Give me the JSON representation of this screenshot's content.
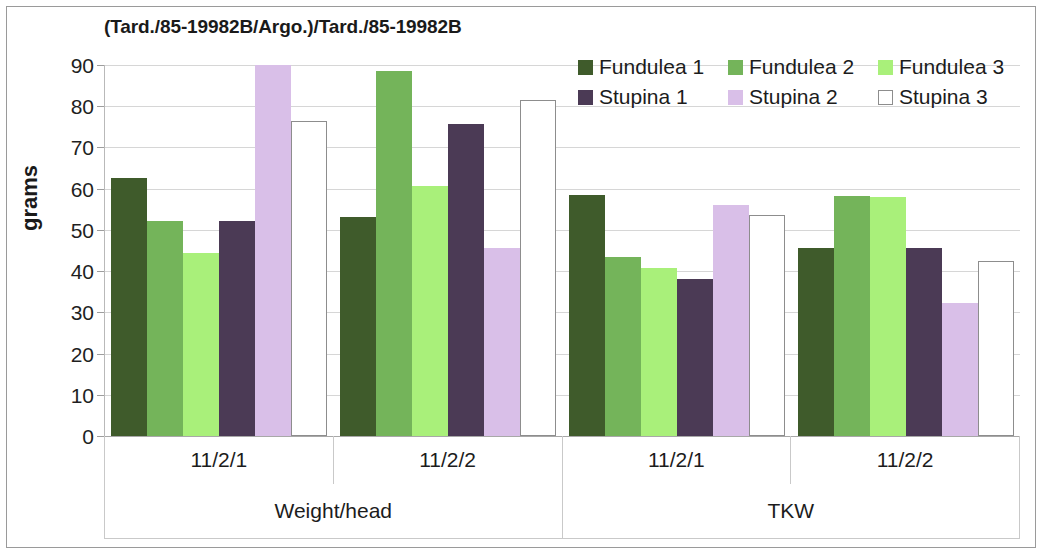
{
  "chart_data": {
    "type": "bar",
    "title": "(Tard./85-19982B/Argo.)/Tard./85-19982B",
    "xlabel": "",
    "ylabel": "grams",
    "ylim": [
      0,
      90
    ],
    "yticks": [
      90,
      80,
      70,
      60,
      50,
      40,
      30,
      20,
      10,
      0
    ],
    "grid": true,
    "legend_position": "top-right",
    "group_labels_level1": [
      "11/2/1",
      "11/2/2",
      "11/2/1",
      "11/2/2"
    ],
    "group_labels_level2": [
      "Weight/head",
      "TKW"
    ],
    "categories": [
      "Weight/head 11/2/1",
      "Weight/head 11/2/2",
      "TKW 11/2/1",
      "TKW 11/2/2"
    ],
    "series": [
      {
        "name": "Fundulea 1",
        "color": "#3f5b2b",
        "values": [
          62.5,
          53.2,
          58.5,
          45.5
        ]
      },
      {
        "name": "Fundulea 2",
        "color": "#74b45a",
        "values": [
          52.2,
          88.6,
          43.4,
          58.2
        ]
      },
      {
        "name": "Fundulea 3",
        "color": "#a9f07a",
        "values": [
          44.5,
          60.6,
          40.8,
          58.0
        ]
      },
      {
        "name": "Stupina 1",
        "color": "#4b3a55",
        "values": [
          52.2,
          75.7,
          38.2,
          45.6
        ]
      },
      {
        "name": "Stupina 2",
        "color": "#d9bfe8",
        "values": [
          90.0,
          45.6,
          56.0,
          32.2
        ]
      },
      {
        "name": "Stupina 3",
        "color": "#ffffff",
        "border": "#8d8d8d",
        "values": [
          76.5,
          81.4,
          53.6,
          42.4
        ]
      }
    ]
  },
  "legend": {
    "rows": [
      [
        {
          "label": "Fundulea 1",
          "color": "#3f5b2b"
        },
        {
          "label": "Fundulea 2",
          "color": "#74b45a"
        },
        {
          "label": "Fundulea 3",
          "color": "#a9f07a"
        }
      ],
      [
        {
          "label": "Stupina 1",
          "color": "#4b3a55"
        },
        {
          "label": "Stupina 2",
          "color": "#d9bfe8"
        },
        {
          "label": "Stupina 3",
          "color": "#ffffff"
        }
      ]
    ]
  }
}
